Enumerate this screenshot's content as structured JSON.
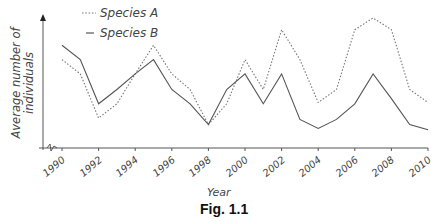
{
  "figure": {
    "caption": "Fig. 1.1",
    "xlabel": "Year",
    "ylabel_line1": "Average number of",
    "ylabel_line2": "individuals"
  },
  "legend": {
    "series_a": "Species A",
    "series_b": "Species B"
  },
  "colors": {
    "series_a": "#777777",
    "series_b": "#555555",
    "axis": "#555555"
  },
  "chart_data": {
    "type": "line",
    "title": "Fig. 1.1",
    "xlabel": "Year",
    "ylabel": "Average number of individuals",
    "x": [
      1990,
      1991,
      1992,
      1993,
      1994,
      1995,
      1996,
      1997,
      1998,
      1999,
      2000,
      2001,
      2002,
      2003,
      2004,
      2005,
      2006,
      2007,
      2008,
      2009,
      2010
    ],
    "tick_labels": [
      "1990",
      "1992",
      "1994",
      "1996",
      "1998",
      "2000",
      "2002",
      "2004",
      "2006",
      "2008",
      "2010"
    ],
    "series": [
      {
        "name": "Species A",
        "style": "dotted",
        "values": [
          68,
          57,
          23,
          34,
          57,
          79,
          57,
          45,
          18,
          34,
          68,
          45,
          91,
          68,
          35,
          45,
          91,
          100,
          91,
          45,
          35
        ]
      },
      {
        "name": "Species B",
        "style": "solid",
        "values": [
          79,
          68,
          34,
          45,
          57,
          68,
          45,
          34,
          18,
          45,
          57,
          34,
          57,
          22,
          15,
          22,
          34,
          57,
          38,
          18,
          14
        ]
      }
    ],
    "ylim": [
      0,
      100
    ],
    "y_ticks_labeled": false,
    "grid": false,
    "legend_position": "top-left",
    "axis_break_on_x": true
  }
}
